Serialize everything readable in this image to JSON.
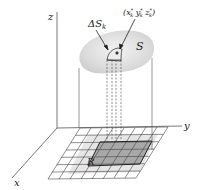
{
  "figure": {
    "axes": {
      "z_label": "z",
      "y_label": "y",
      "x_label": "x"
    },
    "surface_label": "S",
    "patch_label": "ΔS",
    "patch_subscript": "k",
    "point_label": "(x",
    "point_label_full": "(x*k, y*k, z*k)",
    "point_parts": {
      "x": "x",
      "y": "y",
      "z": "z",
      "star": "*",
      "sub": "k",
      "open": "(",
      "close": ")"
    },
    "region_label": "R",
    "colors": {
      "surface": "#d9d9d9",
      "region_fill": "#a8a8a8",
      "region_light": "#e6e6e6",
      "line": "#444444"
    }
  }
}
